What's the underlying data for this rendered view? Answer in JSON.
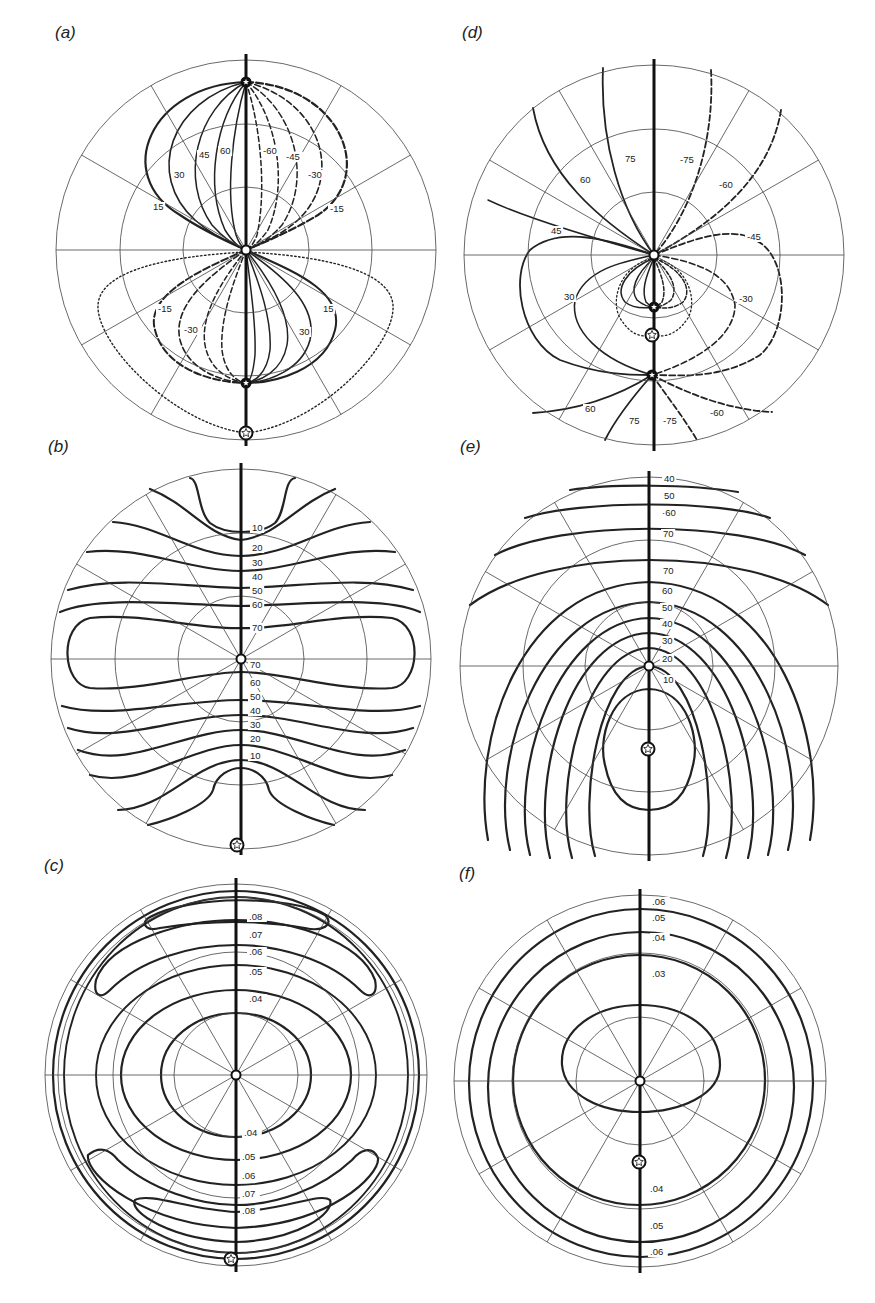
{
  "figure": {
    "width": 875,
    "height": 1303,
    "line_color": "#222222",
    "grid_color": "#444444",
    "background": "#ffffff"
  },
  "panels": [
    {
      "id": "a",
      "label": "(a)",
      "label_pos": [
        55,
        37
      ],
      "center": [
        246,
        250
      ],
      "radius": 190,
      "grid_rings": [
        63,
        126
      ],
      "axis_marker_top": [
        246,
        80
      ],
      "pole_markers": [
        {
          "type": "star-small",
          "x": 246,
          "y": 82
        },
        {
          "type": "open-circle",
          "x": 246,
          "y": 250
        },
        {
          "type": "star-small",
          "x": 246,
          "y": 383
        },
        {
          "type": "star-open",
          "x": 246,
          "y": 433
        }
      ],
      "contour_labels": [
        {
          "text": "60",
          "x": 220,
          "y": 154
        },
        {
          "text": "45",
          "x": 199,
          "y": 158
        },
        {
          "text": "30",
          "x": 174,
          "y": 178
        },
        {
          "text": "15",
          "x": 153,
          "y": 210
        },
        {
          "text": "-60",
          "x": 263,
          "y": 154
        },
        {
          "text": "-45",
          "x": 286,
          "y": 160
        },
        {
          "text": "-30",
          "x": 308,
          "y": 178
        },
        {
          "text": "-15",
          "x": 330,
          "y": 212
        },
        {
          "text": "-15",
          "x": 158,
          "y": 312
        },
        {
          "text": "-30",
          "x": 184,
          "y": 333
        },
        {
          "text": "30",
          "x": 299,
          "y": 335
        },
        {
          "text": "15",
          "x": 323,
          "y": 312
        }
      ]
    },
    {
      "id": "d",
      "label": "(d)",
      "label_pos": [
        462,
        37
      ],
      "center": [
        654,
        255
      ],
      "radius": 190,
      "grid_rings": [
        63,
        126
      ],
      "pole_markers": [
        {
          "type": "open-circle",
          "x": 654,
          "y": 255
        },
        {
          "type": "star-small",
          "x": 654,
          "y": 307
        },
        {
          "type": "star-open",
          "x": 652,
          "y": 335
        },
        {
          "type": "star-small",
          "x": 652,
          "y": 375
        }
      ],
      "contour_labels": [
        {
          "text": "75",
          "x": 625,
          "y": 162
        },
        {
          "text": "60",
          "x": 580,
          "y": 183
        },
        {
          "text": "45",
          "x": 551,
          "y": 234
        },
        {
          "text": "30",
          "x": 564,
          "y": 300
        },
        {
          "text": "-75",
          "x": 680,
          "y": 163
        },
        {
          "text": "-60",
          "x": 719,
          "y": 188
        },
        {
          "text": "-45",
          "x": 747,
          "y": 240
        },
        {
          "text": "-30",
          "x": 739,
          "y": 302
        },
        {
          "text": "60",
          "x": 585,
          "y": 412
        },
        {
          "text": "75",
          "x": 629,
          "y": 424
        },
        {
          "text": "-75",
          "x": 663,
          "y": 424
        },
        {
          "text": "-60",
          "x": 710,
          "y": 416
        }
      ]
    },
    {
      "id": "b",
      "label": "(b)",
      "label_pos": [
        48,
        451
      ],
      "center": [
        241,
        659
      ],
      "radius": 190,
      "grid_rings": [
        63,
        126
      ],
      "pole_markers": [
        {
          "type": "open-circle",
          "x": 241,
          "y": 659
        },
        {
          "type": "star-open",
          "x": 237,
          "y": 845
        }
      ],
      "contour_labels": [
        {
          "text": "10",
          "x": 252,
          "y": 531
        },
        {
          "text": "20",
          "x": 252,
          "y": 551
        },
        {
          "text": "30",
          "x": 252,
          "y": 566
        },
        {
          "text": "40",
          "x": 252,
          "y": 580
        },
        {
          "text": "50",
          "x": 252,
          "y": 594
        },
        {
          "text": "60",
          "x": 252,
          "y": 608
        },
        {
          "text": "70",
          "x": 252,
          "y": 631
        },
        {
          "text": "70",
          "x": 250,
          "y": 668
        },
        {
          "text": "60",
          "x": 250,
          "y": 686
        },
        {
          "text": "50",
          "x": 250,
          "y": 700
        },
        {
          "text": "40",
          "x": 250,
          "y": 714
        },
        {
          "text": "30",
          "x": 250,
          "y": 728
        },
        {
          "text": "20",
          "x": 250,
          "y": 742
        },
        {
          "text": "10",
          "x": 250,
          "y": 759
        }
      ]
    },
    {
      "id": "e",
      "label": "(e)",
      "label_pos": [
        460,
        451
      ],
      "center": [
        649,
        666
      ],
      "radius": 189,
      "grid_rings": [
        64,
        126
      ],
      "pole_markers": [
        {
          "type": "open-circle",
          "x": 649,
          "y": 666
        },
        {
          "type": "star-open",
          "x": 648,
          "y": 749
        }
      ],
      "contour_labels": [
        {
          "text": "40",
          "x": 664,
          "y": 482
        },
        {
          "text": "50",
          "x": 664,
          "y": 499
        },
        {
          "text": "·60",
          "x": 662,
          "y": 516
        },
        {
          "text": "70",
          "x": 663,
          "y": 537
        },
        {
          "text": "70",
          "x": 663,
          "y": 574
        },
        {
          "text": "60",
          "x": 662,
          "y": 594
        },
        {
          "text": "50",
          "x": 662,
          "y": 611
        },
        {
          "text": "40",
          "x": 662,
          "y": 627
        },
        {
          "text": "30",
          "x": 662,
          "y": 644
        },
        {
          "text": "20",
          "x": 662,
          "y": 662
        },
        {
          "text": "10",
          "x": 663,
          "y": 683
        }
      ]
    },
    {
      "id": "c",
      "label": "(c)",
      "label_pos": [
        44,
        870
      ],
      "center": [
        236,
        1075
      ],
      "radius": 191,
      "grid_rings": [
        62,
        123,
        178
      ],
      "pole_markers": [
        {
          "type": "open-circle",
          "x": 236,
          "y": 1075
        },
        {
          "type": "star-open",
          "x": 231,
          "y": 1259
        }
      ],
      "contour_labels": [
        {
          "text": ".08",
          "x": 249,
          "y": 920
        },
        {
          "text": ".07",
          "x": 249,
          "y": 938
        },
        {
          "text": ".06",
          "x": 249,
          "y": 955
        },
        {
          "text": ".05",
          "x": 249,
          "y": 975
        },
        {
          "text": ".04",
          "x": 249,
          "y": 1002
        },
        {
          "text": ".04",
          "x": 244,
          "y": 1136
        },
        {
          "text": ".05",
          "x": 242,
          "y": 1160
        },
        {
          "text": ".06",
          "x": 242,
          "y": 1179
        },
        {
          "text": ".07",
          "x": 242,
          "y": 1197
        },
        {
          "text": ".08",
          "x": 242,
          "y": 1214
        }
      ]
    },
    {
      "id": "f",
      "label": "(f)",
      "label_pos": [
        459,
        878
      ],
      "center": [
        640,
        1081
      ],
      "radius": 186,
      "grid_rings": [
        64,
        128
      ],
      "pole_markers": [
        {
          "type": "open-circle",
          "x": 640,
          "y": 1081
        },
        {
          "type": "star-open",
          "x": 639,
          "y": 1162
        }
      ],
      "contour_labels": [
        {
          "text": ".06",
          "x": 652,
          "y": 905
        },
        {
          "text": ".05",
          "x": 652,
          "y": 921
        },
        {
          "text": ".04",
          "x": 652,
          "y": 941
        },
        {
          "text": ".03",
          "x": 652,
          "y": 977
        },
        {
          "text": ".04",
          "x": 650,
          "y": 1192
        },
        {
          "text": ".05",
          "x": 650,
          "y": 1229
        },
        {
          "text": ".06",
          "x": 650,
          "y": 1255
        }
      ]
    }
  ],
  "chart_data": [
    {
      "type": "heatmap",
      "title": "(a)",
      "projection": "polar stereographic net",
      "contour_levels": [
        -60,
        -45,
        -30,
        -15,
        15,
        30,
        45,
        60
      ],
      "line_styles": {
        "positive": "solid",
        "negative": "dashed",
        "zero": "dotted"
      },
      "grid": {
        "rings": 3,
        "spokes_deg": 30
      }
    },
    {
      "type": "heatmap",
      "title": "(d)",
      "projection": "polar stereographic net",
      "contour_levels": [
        -75,
        -60,
        -45,
        -30,
        30,
        45,
        60,
        75
      ],
      "line_styles": {
        "positive": "solid",
        "negative": "dashed",
        "zero": "dotted"
      },
      "grid": {
        "rings": 3,
        "spokes_deg": 30
      }
    },
    {
      "type": "heatmap",
      "title": "(b)",
      "projection": "polar stereographic net",
      "contour_levels": [
        10,
        20,
        30,
        40,
        50,
        60,
        70
      ],
      "grid": {
        "rings": 3,
        "spokes_deg": 30
      }
    },
    {
      "type": "heatmap",
      "title": "(e)",
      "projection": "polar stereographic net",
      "contour_levels": [
        10,
        20,
        30,
        40,
        50,
        60,
        70
      ],
      "grid": {
        "rings": 3,
        "spokes_deg": 30
      }
    },
    {
      "type": "heatmap",
      "title": "(c)",
      "projection": "polar stereographic net",
      "contour_levels": [
        0.04,
        0.05,
        0.06,
        0.07,
        0.08
      ],
      "grid": {
        "rings": 3,
        "spokes_deg": 30
      }
    },
    {
      "type": "heatmap",
      "title": "(f)",
      "projection": "polar stereographic net",
      "contour_levels": [
        0.03,
        0.04,
        0.05,
        0.06
      ],
      "grid": {
        "rings": 3,
        "spokes_deg": 30
      }
    }
  ]
}
